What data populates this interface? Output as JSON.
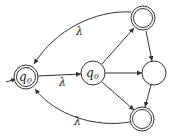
{
  "diagram": {
    "type": "finite-automaton",
    "colors": {
      "stroke": "#333333",
      "background": "#ffffff"
    },
    "states": [
      {
        "id": "q0prime",
        "label": "q0'",
        "accepting": true,
        "initial": true
      },
      {
        "id": "q0",
        "label": "q0",
        "accepting": false
      },
      {
        "id": "top",
        "label": "",
        "accepting": true
      },
      {
        "id": "mid",
        "label": "",
        "accepting": false
      },
      {
        "id": "bottom",
        "label": "",
        "accepting": true
      }
    ],
    "transitions": [
      {
        "from": "q0prime",
        "to": "q0",
        "label": "λ"
      },
      {
        "from": "top",
        "to": "q0prime",
        "label": "λ"
      },
      {
        "from": "bottom",
        "to": "q0prime",
        "label": "λ"
      },
      {
        "from": "q0",
        "to": "top",
        "label": ""
      },
      {
        "from": "q0",
        "to": "mid",
        "label": ""
      },
      {
        "from": "q0",
        "to": "bottom",
        "label": ""
      },
      {
        "from": "top",
        "to": "mid",
        "label": ""
      },
      {
        "from": "mid",
        "to": "bottom",
        "label": ""
      }
    ],
    "text": {
      "q0prime_main": "q",
      "q0prime_sub": "0",
      "q0prime_prime": "′",
      "q0_main": "q",
      "q0_sub": "0",
      "lambda_top": "λ",
      "lambda_mid": "λ",
      "lambda_bottom": "λ"
    }
  }
}
